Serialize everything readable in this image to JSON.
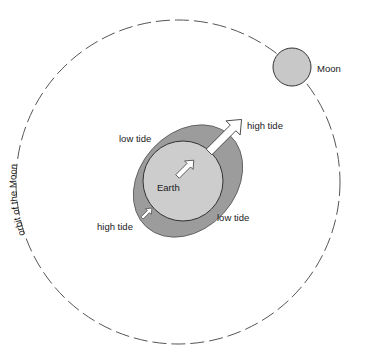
{
  "diagram": {
    "labels": {
      "orbit": "orbit of the Moon",
      "moon": "Moon",
      "earth": "Earth",
      "high_tide_near": "high tide",
      "high_tide_far": "high tide",
      "low_tide_top": "low tide",
      "low_tide_bottom": "low tide"
    },
    "colors": {
      "background": "#ffffff",
      "orbit_line": "#555555",
      "moon_fill": "#c8c8c8",
      "earth_fill": "#cccccc",
      "tidal_bulge_fill": "#999999",
      "arrow_fill": "#ffffff",
      "outline": "#333333"
    },
    "geometry": {
      "orbit": {
        "cx": 178,
        "cy": 182,
        "r": 162
      },
      "moon": {
        "cx": 292,
        "cy": 67,
        "r": 19
      },
      "earth": {
        "cx": 183,
        "cy": 181,
        "r": 40
      },
      "bulge": {
        "cx": 188,
        "cy": 181,
        "rx": 62,
        "ry": 48,
        "rotate": -48
      }
    }
  }
}
